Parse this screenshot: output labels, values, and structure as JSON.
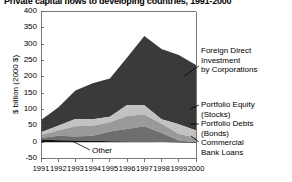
{
  "chart_data": {
    "type": "area",
    "stacked": true,
    "title": "Private capital flows to developing countries, 1991-2000",
    "xlabel": "",
    "ylabel": "$ billion (2000 $)",
    "x": [
      1991,
      1992,
      1993,
      1994,
      1995,
      1996,
      1997,
      1998,
      1999,
      2000
    ],
    "xticklabels": [
      "1991",
      "1992",
      "1993",
      "1994",
      "1995",
      "1996",
      "1997",
      "1998",
      "1999",
      "2000"
    ],
    "yticks": [
      -50,
      0,
      50,
      100,
      150,
      200,
      250,
      300,
      350,
      400
    ],
    "yticklabels": [
      "-50",
      "0",
      "50",
      "100",
      "150",
      "200",
      "250",
      "300",
      "350",
      "400"
    ],
    "ylim": [
      -50,
      400
    ],
    "xlim": [
      1991,
      2000
    ],
    "grid": false,
    "legend_position": "annotated-right",
    "series": [
      {
        "name": "Other",
        "color": "#111111",
        "values": [
          8,
          6,
          5,
          4,
          3,
          2,
          1,
          0,
          -1,
          -2
        ]
      },
      {
        "name": "Commercial Bank Loans",
        "color": "#6e6e6e",
        "values": [
          5,
          14,
          12,
          16,
          30,
          38,
          48,
          28,
          6,
          2
        ]
      },
      {
        "name": "Portfolio Debts (Bonds)",
        "color": "#9a9a9a",
        "values": [
          9,
          16,
          32,
          30,
          28,
          40,
          36,
          28,
          20,
          14
        ]
      },
      {
        "name": "Portfolio Equity (Stocks)",
        "color": "#c2c2c2",
        "values": [
          8,
          14,
          22,
          20,
          17,
          34,
          28,
          14,
          30,
          22
        ]
      },
      {
        "name": "Foreign Direct Investment by Corporations",
        "color": "#3a3a3a",
        "values": [
          38,
          56,
          87,
          110,
          117,
          145,
          212,
          215,
          212,
          200
        ]
      }
    ],
    "annotations": [
      {
        "name": "foreign-direct-investment",
        "lines": [
          "Foreign Direct",
          "Investment",
          "by Corporations"
        ]
      },
      {
        "name": "portfolio-equity",
        "lines": [
          "Portfolio Equity",
          "(Stocks)"
        ]
      },
      {
        "name": "portfolio-debts",
        "lines": [
          "Portfolio Debts",
          "(Bonds)"
        ]
      },
      {
        "name": "commercial-bank-loans",
        "lines": [
          "Commercial",
          "Bank Loans"
        ]
      },
      {
        "name": "other",
        "lines": [
          "Other"
        ]
      }
    ]
  }
}
